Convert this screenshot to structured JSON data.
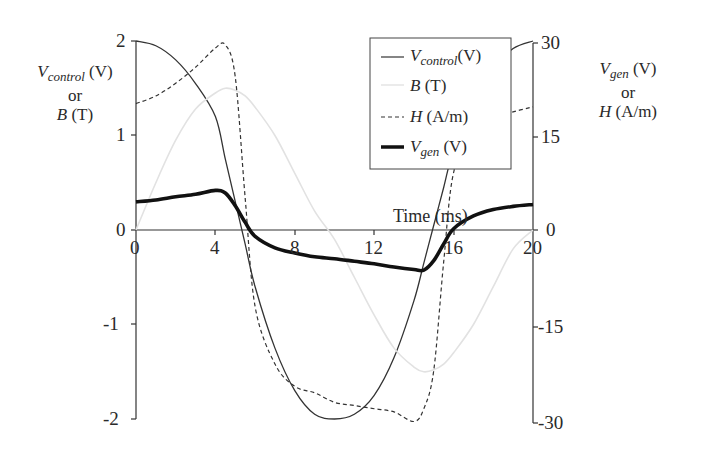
{
  "chart_data": {
    "type": "line",
    "title": "",
    "xlabel": "Time (ms)",
    "ylabel_left": "V_control (V) or B (T)",
    "ylabel_right": "V_gen (V) or H (A/m)",
    "xlim": [
      0,
      20
    ],
    "ylim_left": [
      -2,
      2
    ],
    "ylim_right": [
      -30,
      30
    ],
    "xticks": [
      "0",
      "4",
      "8",
      "12",
      "16",
      "20"
    ],
    "yticks_left": [
      "2",
      "1",
      "0",
      "-1",
      "-2"
    ],
    "yticks_right": [
      "30",
      "15",
      "0",
      "-15",
      "-30"
    ],
    "grid": false,
    "legend_position": "upper-center-right",
    "x": [
      0,
      1,
      2,
      3,
      4,
      4.5,
      5,
      5.5,
      6,
      7,
      8,
      9,
      10,
      11,
      12,
      13,
      14,
      14.5,
      15,
      15.5,
      16,
      17,
      18,
      19,
      20
    ],
    "series": [
      {
        "name": "V_control (V)",
        "axis": "left",
        "style": "solid-thin",
        "values": [
          2.0,
          1.95,
          1.8,
          1.55,
          1.2,
          0.75,
          0.3,
          -0.15,
          -0.6,
          -1.25,
          -1.7,
          -1.95,
          -2.0,
          -1.95,
          -1.75,
          -1.35,
          -0.75,
          -0.35,
          0.05,
          0.45,
          0.85,
          1.35,
          1.7,
          1.92,
          2.0
        ]
      },
      {
        "name": "B (T)",
        "axis": "left",
        "style": "solid-light-gray",
        "values": [
          0.0,
          0.5,
          0.95,
          1.28,
          1.45,
          1.5,
          1.48,
          1.42,
          1.3,
          1.0,
          0.6,
          0.2,
          -0.1,
          -0.5,
          -0.9,
          -1.25,
          -1.45,
          -1.5,
          -1.48,
          -1.42,
          -1.3,
          -1.0,
          -0.6,
          -0.2,
          0.0
        ]
      },
      {
        "name": "H (A/m)",
        "axis": "right",
        "style": "dashed",
        "values": [
          19.8,
          21,
          23,
          25.5,
          28.5,
          29,
          24,
          5,
          -12,
          -21,
          -24.5,
          -25.5,
          -27,
          -27.5,
          -28,
          -28.5,
          -30,
          -28,
          -22,
          -5,
          9,
          15.5,
          17.5,
          18.5,
          19.3
        ]
      },
      {
        "name": "V_gen (V)",
        "axis": "right",
        "style": "solid-thick",
        "values": [
          4.4,
          4.7,
          5.2,
          5.6,
          6.2,
          5.8,
          3.8,
          1.2,
          -1.0,
          -2.8,
          -3.6,
          -4.2,
          -4.5,
          -4.9,
          -5.3,
          -5.8,
          -6.2,
          -6.3,
          -4.8,
          -2.2,
          0.2,
          2.2,
          3.2,
          3.7,
          4.0
        ]
      }
    ]
  },
  "labels": {
    "left_axis_line1_var": "V",
    "left_axis_line1_sub": "control",
    "left_axis_line1_unit": " (V)",
    "left_axis_line2": "or",
    "left_axis_line3_var": "B",
    "left_axis_line3_unit": " (T)",
    "right_axis_line1_var": "V",
    "right_axis_line1_sub": "gen",
    "right_axis_line1_unit": " (V)",
    "right_axis_line2": "or",
    "right_axis_line3_var": "H",
    "right_axis_line3_unit": " (A/m)",
    "x_axis": "Time (ms)"
  },
  "legend": [
    {
      "var": "V",
      "sub": "control",
      "unit": "(V)"
    },
    {
      "var": "B",
      "sub": "",
      "unit": " (T)"
    },
    {
      "var": "H",
      "sub": "",
      "unit": " (A/m)"
    },
    {
      "var": "V",
      "sub": "gen",
      "unit": " (V)"
    }
  ]
}
